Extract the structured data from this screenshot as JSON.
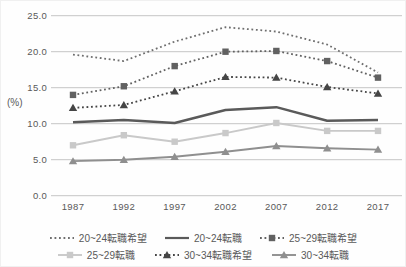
{
  "chart_data": {
    "type": "line",
    "title": "",
    "unit_label": "(%)",
    "xlabel": "",
    "ylabel": "(%)",
    "ylim": [
      0,
      25
    ],
    "grid": "horizontal",
    "legend_position": "bottom",
    "x_categories": [
      "1987",
      "1992",
      "1997",
      "2002",
      "2007",
      "2012",
      "2017"
    ],
    "y_ticks": [
      "25.0",
      "20.0",
      "15.0",
      "10.0",
      "5.0",
      "0.0"
    ],
    "colors": {
      "grid": "#c6c6c6",
      "text": "#595959"
    },
    "series": [
      {
        "name": "20~24転職希望",
        "values": [
          19.6,
          18.7,
          21.4,
          23.4,
          22.8,
          21.0,
          17.1
        ],
        "color": "#6e6e6e",
        "style": "dotted",
        "marker": "none",
        "width": 1.8
      },
      {
        "name": "20~24転職",
        "values": [
          10.2,
          10.5,
          10.1,
          11.9,
          12.3,
          10.4,
          10.5
        ],
        "color": "#5a5a5a",
        "style": "solid",
        "marker": "none",
        "width": 2.5
      },
      {
        "name": "25~29転職希望",
        "values": [
          14.0,
          15.2,
          18.0,
          20.0,
          20.1,
          18.7,
          16.4
        ],
        "color": "#616161",
        "style": "dotted",
        "marker": "square",
        "width": 1.8
      },
      {
        "name": "25~29転職",
        "values": [
          7.0,
          8.4,
          7.5,
          8.7,
          10.1,
          9.0,
          9.0
        ],
        "color": "#c9c9c9",
        "style": "solid",
        "marker": "square",
        "width": 1.9
      },
      {
        "name": "30~34転職希望",
        "values": [
          12.2,
          12.6,
          14.5,
          16.5,
          16.4,
          15.1,
          14.2
        ],
        "color": "#454545",
        "style": "dotted",
        "marker": "triangle",
        "width": 1.8
      },
      {
        "name": "30~34転職",
        "values": [
          4.8,
          5.0,
          5.4,
          6.1,
          6.9,
          6.6,
          6.4
        ],
        "color": "#8f8f8f",
        "style": "solid",
        "marker": "triangle",
        "width": 1.9
      }
    ]
  }
}
